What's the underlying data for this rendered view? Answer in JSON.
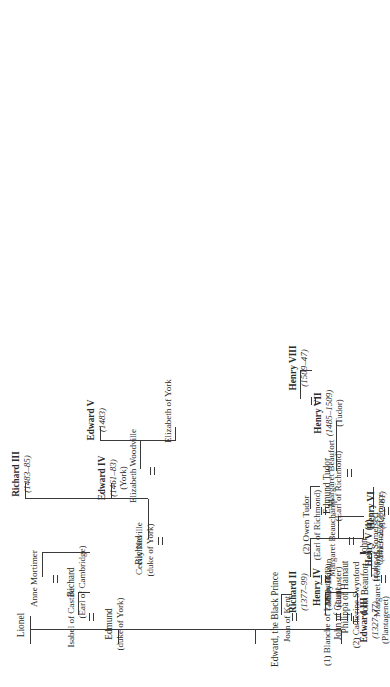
{
  "chart": {
    "type": "genealogy-tree",
    "orientation": "rotated-90-ccw"
  },
  "nodes": {
    "edward_iii": {
      "name": "Edward III",
      "dates": "(1327–77)",
      "house": "(Plantagenet)"
    },
    "philippa": {
      "name": "Philippa of Hainaut"
    },
    "lionel": {
      "name": "Lionel"
    },
    "edmund_york": {
      "name": "Edmund",
      "house": "(duke of York)"
    },
    "isabel_castile": {
      "name": "Isabel of Castile"
    },
    "richard_cambridge": {
      "name": "Richard",
      "house": "(Earl of Cambridge)"
    },
    "anne_mortimer": {
      "name": "Anne Mortimer"
    },
    "richard_york": {
      "name": "Richard",
      "house": "(duke of York)"
    },
    "cecily_neville": {
      "name": "Cecily Neville"
    },
    "richard_iii": {
      "name": "Richard III",
      "dates": "(1483–85)"
    },
    "edward_iv": {
      "name": "Edward IV",
      "dates": "(1461–83)",
      "house": "(York)"
    },
    "elizabeth_wood": {
      "name": "Elizabeth Woodville"
    },
    "edward_v": {
      "name": "Edward V",
      "dates": "(1483)"
    },
    "elizabeth_york": {
      "name": "Elizabeth of York"
    },
    "edward_black": {
      "name": "Edward, the Black Prince"
    },
    "joan_kent": {
      "name": "Joan of Kent"
    },
    "richard_ii": {
      "name": "Richard II",
      "dates": "(1377–99)"
    },
    "blanche_lancaster": {
      "name": "(1) Blanche of Lancaster"
    },
    "john_gaunt": {
      "name": "John of Gaunt"
    },
    "catherine_swyn": {
      "name": "(2) Catherine Swynford"
    },
    "henry_iv": {
      "name": "Henry IV",
      "dates": "(1399–1413)",
      "house": "(Lancaster)"
    },
    "john_beaufort": {
      "name": "John Beaufort"
    },
    "margaret_holland": {
      "name": "Margaret Holland"
    },
    "mary_bohun": {
      "name": "Mary Bohun"
    },
    "john_somerset": {
      "name": "John",
      "house": "(duke of Somerset)"
    },
    "margaret_beauch": {
      "name": "Margaret Beauchamp"
    },
    "henry_v": {
      "name": "Henry V (1)",
      "dates": "(1413–22)"
    },
    "catherine_france": {
      "name": "Catherine of France"
    },
    "owen_tudor": {
      "name": "(2) Owen Tudor",
      "house": "(Earl of Richmond)"
    },
    "henry_vi": {
      "name": "Henry VI",
      "dates": "(1422–61)"
    },
    "edmund_tudor": {
      "name": "Edmund Tudor",
      "house": "(Earl of Richmond)"
    },
    "margaret_beaufort": {
      "name": "Margaret Beaufort"
    },
    "henry_vii": {
      "name": "Henry VII",
      "dates": "(1485–1509)",
      "house": "(Tudor)"
    },
    "henry_viii": {
      "name": "Henry VIII",
      "dates": "(1509–47)"
    }
  },
  "colors": {
    "line": "#3a3a3a",
    "text": "#2b2b2b",
    "background": "#ffffff"
  }
}
